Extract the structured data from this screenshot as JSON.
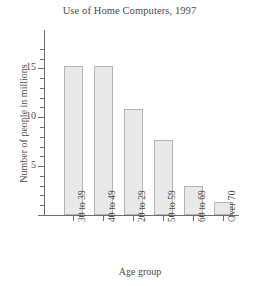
{
  "chart_data": {
    "type": "bar",
    "title": "Use of Home Computers, 1997",
    "xlabel": "Age group",
    "ylabel": "Number of people in millions",
    "categories": [
      "30 to 39",
      "40 to 49",
      "20 to 29",
      "50 to 59",
      "60 to 69",
      "Over 70"
    ],
    "values": [
      15.2,
      15.2,
      10.8,
      7.7,
      3.0,
      1.3
    ],
    "ylim": [
      0,
      17
    ],
    "ytick_major": [
      5,
      10,
      15
    ],
    "ytick_major_labels": [
      "5",
      "10",
      "15"
    ],
    "ytick_minor": [
      1,
      2,
      3,
      4,
      6,
      7,
      8,
      9,
      11,
      12,
      13,
      14,
      16,
      17
    ],
    "grid": false,
    "legend": "none",
    "bar_fill_color": "#e9e9e9",
    "bar_edge_color": "#b4b4b4",
    "axis_color": "#6e6e6e",
    "text_color": "#4a4a4a",
    "background_color": "#ffffff"
  }
}
